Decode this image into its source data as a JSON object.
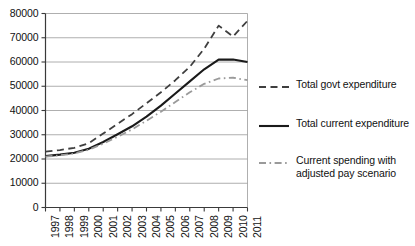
{
  "chart_data": {
    "type": "line",
    "title": "",
    "xlabel": "",
    "ylabel": "",
    "categories": [
      "1997",
      "1998",
      "1999",
      "2000",
      "2001",
      "2002",
      "2003",
      "2004",
      "2005",
      "2006",
      "2007",
      "2008",
      "2009",
      "2010",
      "2011"
    ],
    "ylim": [
      0,
      80000
    ],
    "ytick_labels": [
      "0",
      "10000",
      "20000",
      "30000",
      "40000",
      "50000",
      "60000",
      "70000",
      "80000"
    ],
    "ytick_values": [
      0,
      10000,
      20000,
      30000,
      40000,
      50000,
      60000,
      70000,
      80000
    ],
    "grid": true,
    "legend_position": "right",
    "series": [
      {
        "name": "Total govt expenditure",
        "style": "dashed",
        "color": "#3f3f3f",
        "values": [
          23000,
          23700,
          24600,
          26500,
          30500,
          34500,
          38500,
          43000,
          47500,
          52500,
          58000,
          65500,
          75000,
          70500,
          77000
        ]
      },
      {
        "name": "Total current expenditure",
        "style": "solid",
        "color": "#1a1a1a",
        "values": [
          21200,
          21800,
          22600,
          24200,
          27000,
          30200,
          33500,
          37500,
          42000,
          47000,
          52000,
          57000,
          61000,
          61000,
          60000
        ]
      },
      {
        "name": "Current spending with\nadjusted pay scenario",
        "style": "dashdot",
        "color": "#9a9a9a",
        "values": [
          21000,
          21500,
          22300,
          23800,
          26300,
          29200,
          32200,
          35800,
          39500,
          43500,
          47500,
          51000,
          53200,
          53500,
          52500
        ]
      }
    ]
  },
  "legend": {
    "items": [
      {
        "label": "Total govt expenditure"
      },
      {
        "label": "Total current expenditure"
      },
      {
        "label": "Current spending with\nadjusted pay scenario"
      }
    ]
  },
  "colors": {
    "axis": "#3a3a3a",
    "grid": "#9b9b9b",
    "background": "#ffffff",
    "series_dashed": "#3f3f3f",
    "series_solid": "#1a1a1a",
    "series_dashdot": "#9a9a9a"
  }
}
